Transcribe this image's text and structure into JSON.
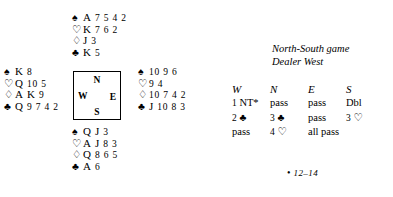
{
  "pips": {
    "spade": "♠",
    "heart": "♡",
    "diamond": "♢",
    "club": "♣"
  },
  "compass": {
    "north": "N",
    "east": "E",
    "south": "S",
    "west": "W"
  },
  "hands": {
    "north": {
      "label": "North",
      "spades": "A 7 5 4 2",
      "hearts": "K 7 6 2",
      "diamonds": "J 3",
      "clubs": "K 5"
    },
    "west": {
      "label": "West",
      "spades": "K 8",
      "hearts": "Q 10 5",
      "diamonds": "A K 9",
      "clubs": "Q 9 7 4 2"
    },
    "east": {
      "label": "East",
      "spades": "10 9 6",
      "hearts": "9 4",
      "diamonds": "10 7 4 2",
      "clubs": "J 10 8 3"
    },
    "south": {
      "label": "South",
      "spades": "Q J 3",
      "hearts": "A J 8 3",
      "diamonds": "Q 8 6 5",
      "clubs": "A 6"
    }
  },
  "conditions": {
    "vulnerability": "North-South game",
    "dealer": "Dealer West"
  },
  "auction": {
    "headers": [
      "W",
      "N",
      "E",
      "S"
    ],
    "rows": [
      [
        "1 NT*",
        "pass",
        "pass",
        "Dbl"
      ],
      [
        "2 ♣",
        "3 ♣",
        "pass",
        "3 ♡"
      ],
      [
        "pass",
        "4 ♡",
        "all pass",
        ""
      ]
    ]
  },
  "footnote": {
    "marker": "•",
    "text": "12–14"
  }
}
